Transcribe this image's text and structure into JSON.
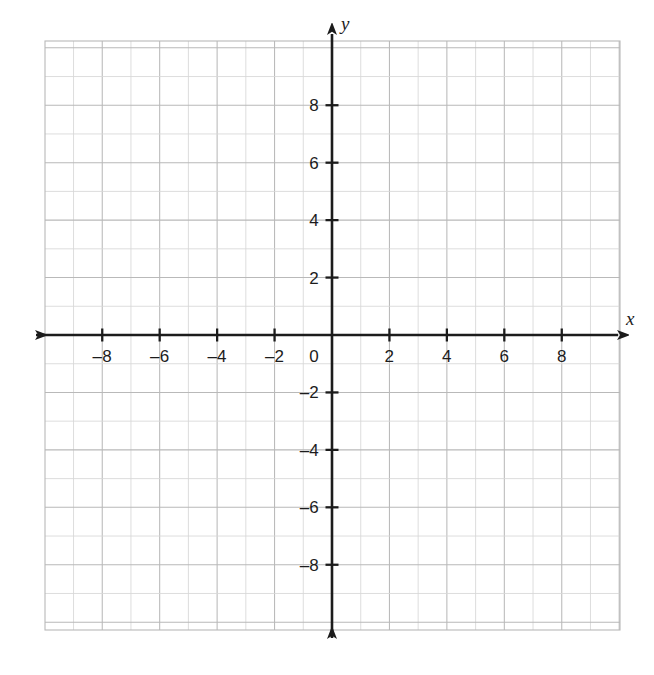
{
  "figure": {
    "kind": "cartesian-coordinate-plane",
    "background_color": "#ffffff",
    "grid_color": "#b9b9b9",
    "grid_minor_color": "#d7d7d7",
    "axis_color": "#1c1c1c",
    "label_color": "#1c1c1c"
  },
  "axes": {
    "x_axis_label": "x",
    "y_axis_label": "y",
    "origin_label": "0"
  },
  "chart_data": {
    "type": "scatter",
    "title": "",
    "subtitle": "",
    "xlabel": "x",
    "ylabel": "y",
    "xlim": [
      -10,
      10
    ],
    "ylim": [
      -10.3,
      10.3
    ],
    "grid": true,
    "grid_step": 1,
    "tick_step": 2,
    "legend": null,
    "annotations": [],
    "series": [],
    "x_tick_values": [
      -8,
      -6,
      -4,
      -2,
      0,
      2,
      4,
      6,
      8
    ],
    "y_tick_values": [
      8,
      6,
      4,
      2,
      -2,
      -4,
      -6,
      -8
    ],
    "x_tick_labels": [
      "–8",
      "–6",
      "–4",
      "–2",
      "0",
      "2",
      "4",
      "6",
      "8"
    ],
    "y_tick_labels": [
      "8",
      "6",
      "4",
      "2",
      "–2",
      "–4",
      "–6",
      "–8"
    ]
  },
  "x_ticks": [
    {
      "value": -8,
      "label": "–8"
    },
    {
      "value": -6,
      "label": "–6"
    },
    {
      "value": -4,
      "label": "–4"
    },
    {
      "value": -2,
      "label": "–2"
    },
    {
      "value": 2,
      "label": "2"
    },
    {
      "value": 4,
      "label": "4"
    },
    {
      "value": 6,
      "label": "6"
    },
    {
      "value": 8,
      "label": "8"
    }
  ],
  "y_ticks": [
    {
      "value": 8,
      "label": "8"
    },
    {
      "value": 6,
      "label": "6"
    },
    {
      "value": 4,
      "label": "4"
    },
    {
      "value": 2,
      "label": "2"
    },
    {
      "value": -2,
      "label": "–2"
    },
    {
      "value": -4,
      "label": "–4"
    },
    {
      "value": -6,
      "label": "–6"
    },
    {
      "value": -8,
      "label": "–8"
    }
  ]
}
